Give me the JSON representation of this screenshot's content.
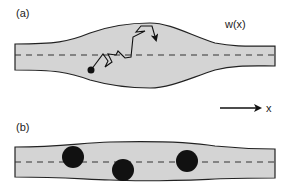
{
  "panel_a": {
    "label": "(a)",
    "width_label": "w(x)",
    "channel_fill": "#d4d4d4",
    "particle_color": "#111111"
  },
  "panel_b": {
    "label": "(b)",
    "particle_count": 3,
    "particle_color": "#111111"
  },
  "axis": {
    "label": "x",
    "direction": "right"
  }
}
